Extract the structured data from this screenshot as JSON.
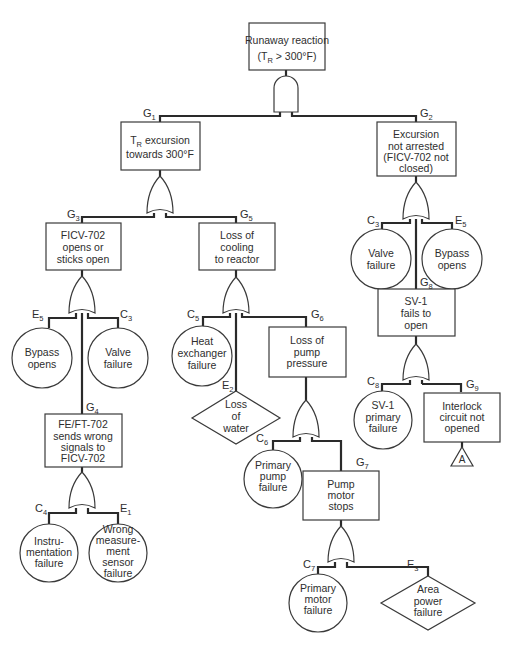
{
  "diagram": {
    "type": "fault-tree",
    "top_event": {
      "id": "top",
      "lines": [
        "Runaway reaction",
        "(T_R > 300°F)"
      ],
      "line1": "Runaway reaction",
      "line2a": "(T",
      "line2sub": "R",
      "line2b": " > 300°F)"
    },
    "gates": {
      "top_gate": "AND",
      "G1_gate": "OR",
      "G2_gate": "OR",
      "G3_gate": "OR",
      "G4_gate": "OR",
      "G5_gate": "OR",
      "G6_gate": "OR",
      "G7_gate": "OR",
      "G8_gate": "OR"
    },
    "labels": {
      "G1": {
        "main": "G",
        "sub": "1"
      },
      "G2": {
        "main": "G",
        "sub": "2"
      },
      "G3": {
        "main": "G",
        "sub": "3"
      },
      "G4": {
        "main": "G",
        "sub": "4"
      },
      "G5": {
        "main": "G",
        "sub": "5"
      },
      "G6": {
        "main": "G",
        "sub": "6"
      },
      "G7": {
        "main": "G",
        "sub": "7"
      },
      "G8": {
        "main": "G",
        "sub": "8"
      },
      "G9": {
        "main": "G",
        "sub": "9"
      },
      "C3a": {
        "main": "C",
        "sub": "3"
      },
      "C3b": {
        "main": "C",
        "sub": "3"
      },
      "C4": {
        "main": "C",
        "sub": "4"
      },
      "C5": {
        "main": "C",
        "sub": "5"
      },
      "C6": {
        "main": "C",
        "sub": "6"
      },
      "C7": {
        "main": "C",
        "sub": "7"
      },
      "C8": {
        "main": "C",
        "sub": "8"
      },
      "E1": {
        "main": "E",
        "sub": "1"
      },
      "E2": {
        "main": "E",
        "sub": "2"
      },
      "E3": {
        "main": "E",
        "sub": "3"
      },
      "E5a": {
        "main": "E",
        "sub": "5"
      },
      "E5b": {
        "main": "E",
        "sub": "5"
      }
    },
    "events": {
      "G1": {
        "line1a": "T",
        "line1sub": "R",
        "line1b": " excursion",
        "line2": "towards 300°F"
      },
      "G2": {
        "lines": [
          "Excursion",
          "not arrested",
          "(FICV-702 not",
          "closed)"
        ]
      },
      "G3": {
        "lines": [
          "FICV-702",
          "opens or",
          "sticks open"
        ]
      },
      "G4": {
        "lines": [
          "FE/FT-702",
          "sends wrong",
          "signals to",
          "FICV-702"
        ]
      },
      "G5": {
        "lines": [
          "Loss of",
          "cooling",
          "to reactor"
        ]
      },
      "G6": {
        "lines": [
          "Loss of",
          "pump",
          "pressure"
        ]
      },
      "G7": {
        "lines": [
          "Pump",
          "motor",
          "stops"
        ]
      },
      "G8": {
        "lines": [
          "SV-1",
          "fails to",
          "open"
        ]
      },
      "G9": {
        "lines": [
          "Interlock",
          "circuit not",
          "opened"
        ]
      },
      "E5a": {
        "lines": [
          "Bypass",
          "opens"
        ]
      },
      "C3a": {
        "lines": [
          "Valve",
          "failure"
        ]
      },
      "C4": {
        "lines": [
          "Instru-",
          "mentation",
          "failure"
        ]
      },
      "E1": {
        "lines": [
          "Wrong",
          "measure-",
          "ment",
          "sensor",
          "failure"
        ]
      },
      "C5": {
        "lines": [
          "Heat",
          "exchanger",
          "failure"
        ]
      },
      "E2": {
        "lines": [
          "Loss",
          "of",
          "water"
        ]
      },
      "C6": {
        "lines": [
          "Primary",
          "pump",
          "failure"
        ]
      },
      "C7": {
        "lines": [
          "Primary",
          "motor",
          "failure"
        ]
      },
      "E3": {
        "lines": [
          "Area",
          "power",
          "failure"
        ]
      },
      "C3b": {
        "lines": [
          "Valve",
          "failure"
        ]
      },
      "E5b": {
        "lines": [
          "Bypass",
          "opens"
        ]
      },
      "C8": {
        "lines": [
          "SV-1",
          "primary",
          "failure"
        ]
      },
      "transfer_A": {
        "label": "A"
      }
    }
  }
}
